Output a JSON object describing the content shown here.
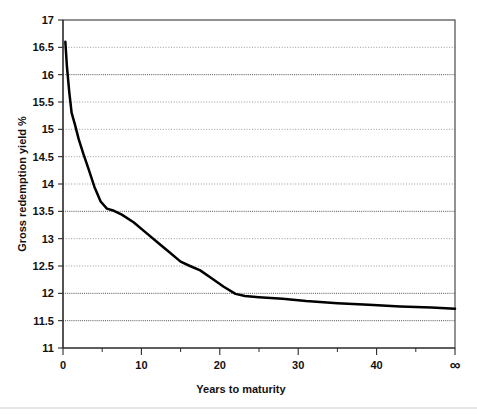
{
  "chart_data": {
    "type": "line",
    "title": "",
    "xlabel": "Years to maturity",
    "ylabel": "Gross redemption yield %",
    "xlim": [
      0,
      50
    ],
    "ylim": [
      11,
      17
    ],
    "grid": true,
    "legend": null,
    "x_tick_labels": [
      "0",
      "10",
      "20",
      "30",
      "40",
      "∞"
    ],
    "x_tick_values": [
      0,
      10,
      20,
      30,
      40,
      50
    ],
    "x_minor_tick_values": [
      5,
      15,
      25,
      35,
      45
    ],
    "y_tick_labels": [
      "11",
      "11.5",
      "12",
      "12.5",
      "13",
      "13.5",
      "14",
      "14.5",
      "15",
      "15.5",
      "16",
      "16.5",
      "17"
    ],
    "y_tick_values": [
      11,
      11.5,
      12,
      12.5,
      13,
      13.5,
      14,
      14.5,
      15,
      15.5,
      16,
      16.5,
      17
    ],
    "series": [
      {
        "name": "Gross redemption yield",
        "color": "#000000",
        "x": [
          0.3,
          0.5,
          0.8,
          1.1,
          1.5,
          2.0,
          2.6,
          3.2,
          4.0,
          4.8,
          5.6,
          6.5,
          7.5,
          9.0,
          10.5,
          12.0,
          13.5,
          15.0,
          16.2,
          17.5,
          19.0,
          20.5,
          22.0,
          23.2,
          25.0,
          28.0,
          31.0,
          35.0,
          39.0,
          43.0,
          47.0,
          50.0
        ],
        "y": [
          16.6,
          16.15,
          15.68,
          15.3,
          15.1,
          14.82,
          14.55,
          14.3,
          13.95,
          13.68,
          13.55,
          13.51,
          13.44,
          13.3,
          13.12,
          12.94,
          12.76,
          12.58,
          12.5,
          12.42,
          12.27,
          12.12,
          11.99,
          11.95,
          11.93,
          11.9,
          11.86,
          11.82,
          11.79,
          11.76,
          11.74,
          11.72
        ]
      }
    ]
  },
  "axis_titles": {
    "x": "Years to maturity",
    "y": "Gross redemption yield %"
  }
}
